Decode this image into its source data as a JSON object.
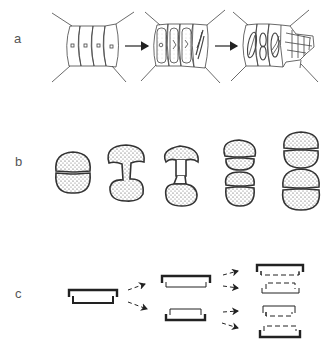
{
  "panels": [
    {
      "id": "a",
      "label": "a",
      "description": "Filament cells developing: plain cells, then cytoplasm differentiation with spiral structures, then further divided cells"
    },
    {
      "id": "b",
      "label": "b",
      "description": "Stippled cell division sequence: constricted cell, dumbbell, connected halves, two paired cells, four-part cells"
    },
    {
      "id": "c",
      "label": "c",
      "description": "Frustule/valve inheritance diagram: one box splits into two, each splits into two with dashed new valves"
    }
  ],
  "colors": {
    "stroke": "#333333",
    "stipple_fill": "#dddddd",
    "background": "#ffffff",
    "label": "#555555"
  }
}
